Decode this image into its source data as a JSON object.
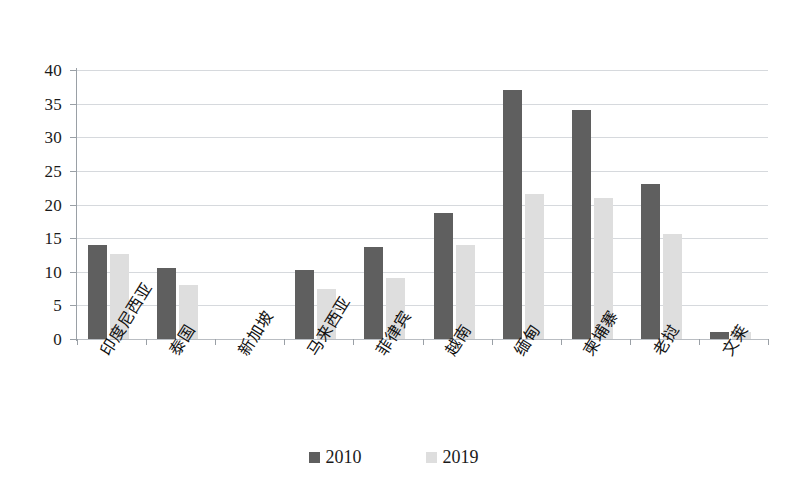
{
  "chart_data": {
    "type": "bar",
    "title": "",
    "subtitle": "",
    "xlabel": "",
    "ylabel": "",
    "ylim": [
      0,
      40
    ],
    "y_ticks": [
      0,
      5,
      10,
      15,
      20,
      25,
      30,
      35,
      40
    ],
    "grid": true,
    "legend_position": "bottom",
    "categories": [
      "印度尼西亚",
      "泰国",
      "新加坡",
      "马来西亚",
      "菲律宾",
      "越南",
      "缅甸",
      "柬埔寨",
      "老挝",
      "文莱"
    ],
    "series": [
      {
        "name": "2010",
        "color": "#5f5f5f",
        "values": [
          14.0,
          10.6,
          0,
          10.2,
          13.7,
          18.7,
          37.0,
          34.0,
          23.0,
          1.0
        ]
      },
      {
        "name": "2019",
        "color": "#dedede",
        "values": [
          12.7,
          8.0,
          0,
          7.4,
          9.0,
          14.0,
          21.5,
          21.0,
          15.6,
          1.0
        ]
      }
    ]
  },
  "legend": {
    "items": [
      {
        "label": "2010",
        "color": "#5f5f5f"
      },
      {
        "label": "2019",
        "color": "#dedede"
      }
    ]
  },
  "colors": {
    "series_2010": "#5f5f5f",
    "series_2019": "#dedede",
    "gridline": "#d6d9dd",
    "axis": "#9aa0a6",
    "background": "#ffffff",
    "text": "#1a1a1a"
  }
}
